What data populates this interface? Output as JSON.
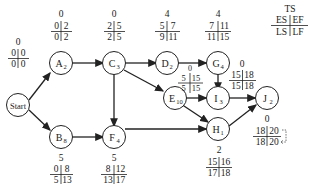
{
  "legend": {
    "ts": "TS",
    "es": "ES",
    "ef": "EF",
    "ls": "LS",
    "lf": "LF"
  },
  "nodes": {
    "start": {
      "name": "Start",
      "sub": "",
      "ts": "0",
      "es": "0",
      "ef": "0",
      "ls": "0",
      "lf": "0"
    },
    "a": {
      "name": "A",
      "sub": "2",
      "ts": "0",
      "es": "0",
      "ef": "2",
      "ls": "0",
      "lf": "2"
    },
    "b": {
      "name": "B",
      "sub": "8",
      "ts": "5",
      "es": "0",
      "ef": "8",
      "ls": "5",
      "lf": "13"
    },
    "c": {
      "name": "C",
      "sub": "3",
      "ts": "0",
      "es": "2",
      "ef": "5",
      "ls": "2",
      "lf": "5"
    },
    "d": {
      "name": "D",
      "sub": "2",
      "ts": "4",
      "es": "5",
      "ef": "7",
      "ls": "9",
      "lf": "11"
    },
    "e": {
      "name": "E",
      "sub": "10",
      "ts": "0",
      "es": "5",
      "ef": "15",
      "ls": "5",
      "lf": "15"
    },
    "f": {
      "name": "F",
      "sub": "4",
      "ts": "5",
      "es": "8",
      "ef": "12",
      "ls": "13",
      "lf": "17"
    },
    "g": {
      "name": "G",
      "sub": "4",
      "ts": "4",
      "es": "7",
      "ef": "11",
      "ls": "11",
      "lf": "15"
    },
    "h": {
      "name": "H",
      "sub": "1",
      "ts": "2",
      "es": "15",
      "ef": "16",
      "ls": "17",
      "lf": "18"
    },
    "i": {
      "name": "I",
      "sub": "3",
      "ts": "0",
      "es": "15",
      "ef": "18",
      "ls": "15",
      "lf": "18"
    },
    "j": {
      "name": "J",
      "sub": "2",
      "ts": "0",
      "es": "18",
      "ef": "20",
      "ls": "18",
      "lf": "20"
    }
  },
  "edges": [
    [
      "start",
      "a"
    ],
    [
      "start",
      "b"
    ],
    [
      "a",
      "c"
    ],
    [
      "b",
      "f"
    ],
    [
      "c",
      "d"
    ],
    [
      "c",
      "e"
    ],
    [
      "c",
      "f"
    ],
    [
      "d",
      "g"
    ],
    [
      "g",
      "i"
    ],
    [
      "e",
      "i"
    ],
    [
      "e",
      "h"
    ],
    [
      "f",
      "h"
    ],
    [
      "i",
      "j"
    ],
    [
      "h",
      "j"
    ]
  ]
}
